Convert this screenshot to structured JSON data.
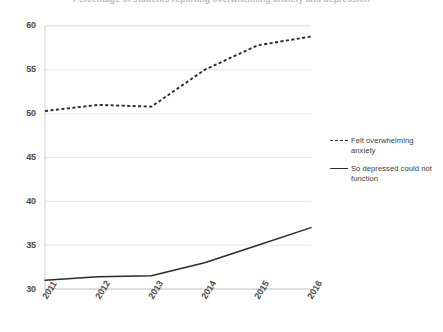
{
  "chart_data": {
    "type": "line",
    "title": "Percentage of students reporting overwhelming anxiety and depression",
    "subtitle": "",
    "xlabel": "",
    "ylabel": "",
    "x": [
      "2011",
      "2012",
      "2013",
      "2014",
      "2015",
      "2016"
    ],
    "categories": [
      "2011",
      "2012",
      "2013",
      "2014",
      "2015",
      "2016"
    ],
    "series": [
      {
        "name": "Felt overwhelming anxiety",
        "style": "dashed",
        "color": "#2b2b2b",
        "values": [
          50.3,
          51.0,
          50.8,
          55.0,
          57.8,
          58.8
        ]
      },
      {
        "name": "So depressed could not function",
        "style": "solid",
        "color": "#2b2b2b",
        "values": [
          31.0,
          31.4,
          31.5,
          33.0,
          35.0,
          37.0
        ]
      }
    ],
    "ylim": [
      30,
      60
    ],
    "yticks": [
      30,
      35,
      40,
      45,
      50,
      55,
      60
    ],
    "ytick_labels": [
      "30",
      "35",
      "40",
      "45",
      "50",
      "55",
      "60"
    ],
    "xtick_labels": [
      "2011",
      "2012",
      "2013",
      "2014",
      "2015",
      "2016"
    ],
    "grid": true,
    "grid_axis": "y",
    "grid_color": "#e3e3e6",
    "legend_position": "right",
    "legend": [
      "Felt overwhelming anxiety",
      "So depressed could not function"
    ]
  },
  "legend": {
    "entries": [
      {
        "label": "Felt overwhelming anxiety"
      },
      {
        "label": "So depressed could not function"
      }
    ]
  },
  "axes": {
    "y_labels": [
      "60",
      "55",
      "50",
      "45",
      "40",
      "35",
      "30"
    ],
    "x_labels": [
      "2011",
      "2012",
      "2013",
      "2014",
      "2015",
      "2016"
    ]
  }
}
